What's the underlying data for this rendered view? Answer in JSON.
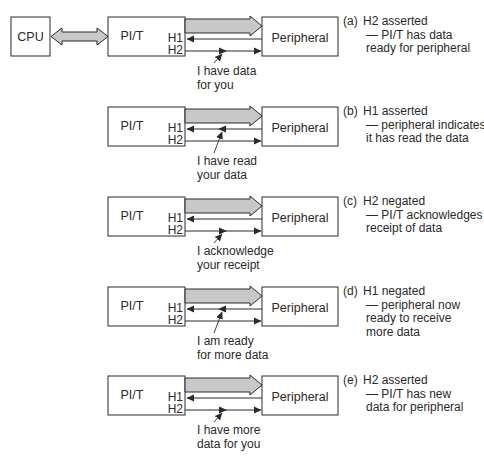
{
  "figure": {
    "cpu_label": "CPU",
    "pit_label": "PI/T",
    "peripheral_label": "Peripheral",
    "h1_label": "H1",
    "h2_label": "H2",
    "colors": {
      "line": "#2a2a2a",
      "bus_fill": "#c8c8c8",
      "box_fill": "#ffffff"
    }
  },
  "panels": [
    {
      "id": "a",
      "tag": "(a)",
      "caption_lines": [
        "H2 asserted",
        "— PI/T has data",
        "ready for peripheral"
      ],
      "note_lines": [
        "I have data",
        "for you"
      ],
      "event_signal": "H2",
      "show_cpu": true
    },
    {
      "id": "b",
      "tag": "(b)",
      "caption_lines": [
        "H1 asserted",
        "— peripheral indicates",
        "it has read the data"
      ],
      "note_lines": [
        "I have read",
        "your data"
      ],
      "event_signal": "H1",
      "show_cpu": false
    },
    {
      "id": "c",
      "tag": "(c)",
      "caption_lines": [
        "H2 negated",
        "— PI/T acknowledges",
        "receipt of data"
      ],
      "note_lines": [
        "I acknowledge",
        "your receipt"
      ],
      "event_signal": "H2",
      "show_cpu": false
    },
    {
      "id": "d",
      "tag": "(d)",
      "caption_lines": [
        "H1 negated",
        "— peripheral now",
        "ready to receive",
        "more data"
      ],
      "note_lines": [
        "I am ready",
        "for more data"
      ],
      "event_signal": "H1",
      "show_cpu": false
    },
    {
      "id": "e",
      "tag": "(e)",
      "caption_lines": [
        "H2 asserted",
        "— PI/T has new",
        "data for peripheral"
      ],
      "note_lines": [
        "I have more",
        "data for you"
      ],
      "event_signal": "H2",
      "show_cpu": false
    }
  ]
}
